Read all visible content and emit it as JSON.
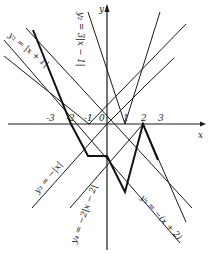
{
  "figure": {
    "axes": {
      "x_label": "x",
      "y_label": "y",
      "origin_label": "0",
      "x_ticks": [
        "-3",
        "-2",
        "-1",
        "1",
        "2",
        "3"
      ]
    },
    "equations": {
      "y1": "y₁ = |x + 1|",
      "y2": "y₂ = 3|x − 1|",
      "y3": "y₃ = −|x|",
      "y4": "y₄ = −2|x − 2|",
      "y5": "y₅ = −(x + 2)"
    },
    "colors": {
      "ink": "#1a1a1a",
      "background": "#ffffff"
    }
  }
}
